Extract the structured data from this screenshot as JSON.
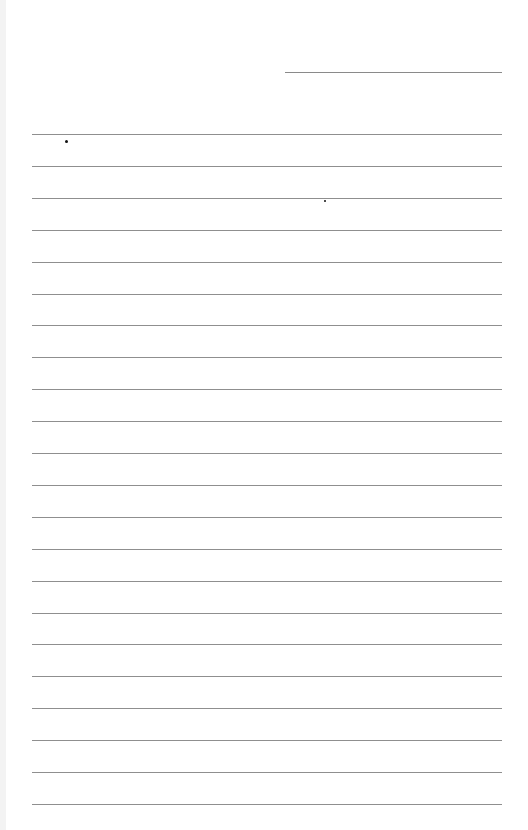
{
  "page": {
    "type": "lined-paper",
    "background": "#ffffff",
    "rule_color": "#8f8f8f",
    "header_line": {
      "x": 285,
      "y": 72,
      "width": 217
    },
    "rules": {
      "count": 22,
      "x": 32,
      "width": 470,
      "first_y": 134,
      "spacing": 31.9
    },
    "marks": [
      {
        "x": 65,
        "y": 140,
        "size": 3
      },
      {
        "x": 324,
        "y": 200,
        "size": 2
      }
    ]
  }
}
